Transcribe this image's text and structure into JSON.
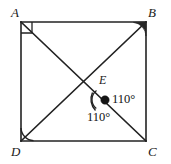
{
  "figure": {
    "type": "geometry-diagram",
    "stroke_color": "#222222",
    "background_color": "#ffffff",
    "vertices": [
      {
        "id": "A",
        "label": "A",
        "x": 21,
        "y": 22,
        "label_x": 11,
        "label_y": 6,
        "marker": "right-angle-square"
      },
      {
        "id": "B",
        "label": "B",
        "x": 146,
        "y": 22,
        "label_x": 148,
        "label_y": 6,
        "marker": "angle-arc-filled"
      },
      {
        "id": "C",
        "label": "C",
        "x": 146,
        "y": 141,
        "label_x": 148,
        "label_y": 145,
        "marker": "none"
      },
      {
        "id": "D",
        "label": "D",
        "x": 21,
        "y": 141,
        "label_x": 11,
        "label_y": 145,
        "marker": "angle-arc"
      },
      {
        "id": "E",
        "label": "E",
        "x": 105,
        "y": 100,
        "label_x": 99,
        "label_y": 74,
        "marker": "filled-dot"
      }
    ],
    "square_sides": [
      {
        "name": "side-AB",
        "from": "A",
        "to": "B"
      },
      {
        "name": "side-BC",
        "from": "B",
        "to": "C"
      },
      {
        "name": "side-CD",
        "from": "C",
        "to": "D"
      },
      {
        "name": "side-DA",
        "from": "D",
        "to": "A"
      }
    ],
    "segments": [
      {
        "name": "segment-AC",
        "from": "A",
        "to": "C",
        "through": "E"
      },
      {
        "name": "segment-DB",
        "from": "D",
        "to": "B",
        "through": "E"
      }
    ],
    "angle_markers": [
      {
        "name": "angle-at-E-right",
        "value": "110°",
        "vertex": "E",
        "label_x": 112,
        "label_y": 93
      },
      {
        "name": "angle-at-E-lower",
        "value": "110°",
        "vertex": "E",
        "label_x": 87,
        "label_y": 111
      }
    ]
  }
}
